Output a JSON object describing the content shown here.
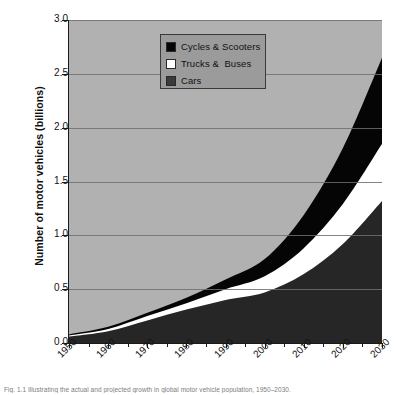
{
  "chart_data": {
    "type": "area",
    "stacked": true,
    "title": "",
    "xlabel": "",
    "ylabel": "Number of motor vehicles (billions)",
    "x": [
      1950,
      1960,
      1970,
      1980,
      1990,
      2000,
      2010,
      2020,
      2030
    ],
    "xtick_labels": [
      "1950",
      "1960",
      "1970",
      "1980",
      "1990",
      "2000",
      "2010",
      "2020",
      "2030"
    ],
    "ytick_labels": [
      "0.0",
      "0.5",
      "1.0",
      "1.5",
      "2.0",
      "2.5",
      "3.0"
    ],
    "ytick_values": [
      0.0,
      0.5,
      1.0,
      1.5,
      2.0,
      2.5,
      3.0
    ],
    "ylim": [
      0.0,
      3.0
    ],
    "xlim": [
      1950,
      2030
    ],
    "grid": true,
    "legend_position": "top-center",
    "series": [
      {
        "name": "Cars",
        "color": "#262626",
        "order": 1,
        "values": [
          0.06,
          0.11,
          0.21,
          0.31,
          0.4,
          0.47,
          0.64,
          0.92,
          1.32
        ]
      },
      {
        "name": "Trucks &  Buses",
        "color": "#ffffff",
        "order": 2,
        "values": [
          0.01,
          0.02,
          0.04,
          0.06,
          0.1,
          0.15,
          0.24,
          0.37,
          0.53
        ]
      },
      {
        "name": "Cycles & Scooters",
        "color": "#050505",
        "order": 3,
        "values": [
          0.01,
          0.02,
          0.03,
          0.05,
          0.09,
          0.16,
          0.31,
          0.52,
          0.8
        ]
      }
    ],
    "cumulative_totals": [
      0.08,
      0.15,
      0.28,
      0.42,
      0.59,
      0.78,
      1.19,
      1.81,
      2.65
    ],
    "plot_background_color": "#b1b1b1",
    "legend_background_color": "#9b9b9b",
    "gridline_color": "#6f6f6f"
  },
  "legend": {
    "entries": [
      {
        "label": "Cycles & Scooters",
        "swatch": "#050505"
      },
      {
        "label": "Trucks &  Buses",
        "swatch": "#ffffff"
      },
      {
        "label": "Cars",
        "swatch": "#3a3a3a"
      }
    ]
  },
  "caption": {
    "text": "Fig. 1.1 Illustrating the actual and projected growth in global motor vehicle population, 1950–2030."
  }
}
